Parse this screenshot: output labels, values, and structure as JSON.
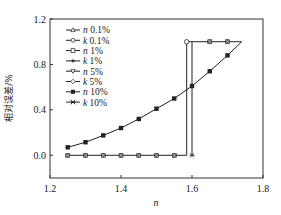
{
  "chart_data": {
    "type": "line",
    "title": "",
    "xlabel": "n",
    "ylabel": "相对误差/%",
    "xlim": [
      1.2,
      1.8
    ],
    "ylim": [
      -0.2,
      1.2
    ],
    "xticks": [
      "1.2",
      "1.4",
      "1.6",
      "1.8"
    ],
    "yticks": [
      "0.0",
      "0.4",
      "0.8",
      "1.2"
    ],
    "grid": false,
    "legend_position": "upper-left",
    "legend": [
      "n 0.1%",
      "k 0.1%",
      "n 1%",
      "k 1%",
      "n 5%",
      "k 5%",
      "n 10%",
      "k 10%"
    ],
    "series": [
      {
        "name": "n (all errors)",
        "x": [
          1.25,
          1.3,
          1.35,
          1.4,
          1.45,
          1.5,
          1.55,
          1.6,
          1.65,
          1.7,
          1.74
        ],
        "values": [
          0.07,
          0.115,
          0.175,
          0.24,
          0.32,
          0.41,
          0.5,
          0.61,
          0.74,
          0.88,
          1.0
        ]
      },
      {
        "name": "k (all errors)",
        "x": [
          1.25,
          1.3,
          1.35,
          1.4,
          1.45,
          1.5,
          1.55,
          1.585,
          1.585,
          1.6,
          1.65,
          1.7,
          1.74
        ],
        "values": [
          0,
          0,
          0,
          0,
          0,
          0,
          0,
          0,
          1.0,
          1.0,
          1.0,
          1.0,
          1.0
        ]
      },
      {
        "name": "k step (n=1.60)",
        "x": [
          1.6,
          1.6
        ],
        "values": [
          0,
          1.0
        ]
      }
    ]
  },
  "labels": {
    "xlabel": "n",
    "ylabel": "相对误差/%",
    "xticks": [
      "1.2",
      "1.4",
      "1.6",
      "1.8"
    ],
    "yticks": [
      "0.0",
      "0.4",
      "0.8",
      "1.2"
    ]
  },
  "legend": [
    {
      "var": "n",
      "pct": " 0.1%",
      "marker": "triangle-up"
    },
    {
      "var": "k",
      "pct": " 0.1%",
      "marker": "circle"
    },
    {
      "var": "n",
      "pct": " 1%",
      "marker": "square"
    },
    {
      "var": "k",
      "pct": " 1%",
      "marker": "star"
    },
    {
      "var": "n",
      "pct": " 5%",
      "marker": "triangle-down"
    },
    {
      "var": "k",
      "pct": " 5%",
      "marker": "diamond"
    },
    {
      "var": "n",
      "pct": " 10%",
      "marker": "filled-square"
    },
    {
      "var": "k",
      "pct": " 10%",
      "marker": "x-square"
    }
  ]
}
